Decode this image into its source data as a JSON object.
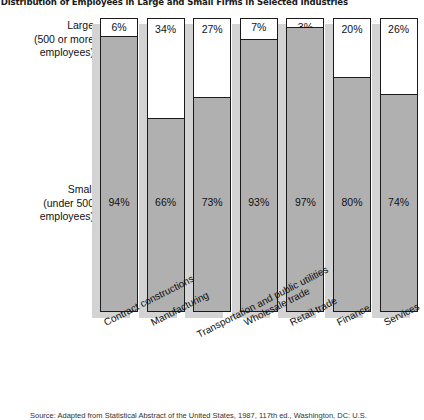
{
  "chart_data": {
    "type": "bar",
    "subtype": "stacked-100-percent",
    "title": "t Distribution of Employees in Large and Small Firms in Selected Industries",
    "xlabel": "",
    "ylabel": "",
    "ylim": [
      0,
      100
    ],
    "grid": false,
    "legend_position": "y-axis-labels",
    "value_unit": "%",
    "categories": [
      "Contract constructions",
      "Manufacturing",
      "Transportation and public utilities",
      "Wholesale trade",
      "Retail trade",
      "Finance",
      "Services"
    ],
    "series": [
      {
        "name": "Large (500 or more employees)",
        "color": "#ffffff",
        "values": [
          6,
          34,
          27,
          7,
          3,
          20,
          26
        ],
        "labels": [
          "6%",
          "34%",
          "27%",
          "7%",
          "3%",
          "20%",
          "26%"
        ]
      },
      {
        "name": "Small (under 500 employees)",
        "color": "#b0b0b0",
        "values": [
          94,
          66,
          73,
          93,
          97,
          80,
          74
        ],
        "labels": [
          "94%",
          "66%",
          "73%",
          "93%",
          "97%",
          "80%",
          "74%"
        ]
      }
    ]
  },
  "axis_labels": {
    "large": {
      "line1": "Large",
      "line2": "(500 or more",
      "line3": "employees)"
    },
    "small": {
      "line1": "Small",
      "line2": "(under 500",
      "line3": "employees)"
    }
  },
  "source": {
    "text": "Source: Adapted from Statistical Abstract of the United States, 1987, 117th ed., Washington, DC: U.S."
  }
}
